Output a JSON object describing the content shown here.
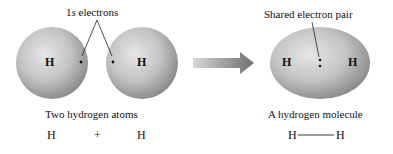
{
  "left_panel": {
    "callout_label": "1s electrons",
    "atom_left_symbol": "H",
    "atom_right_symbol": "H",
    "caption": "Two hydrogen atoms",
    "equation": {
      "left": "H",
      "operator": "+",
      "right": "H"
    }
  },
  "arrow": {
    "direction": "right",
    "icon": "gradient-arrow-icon"
  },
  "right_panel": {
    "callout_label": "Shared electron pair",
    "atom_left_symbol": "H",
    "atom_right_symbol": "H",
    "caption": "A hydrogen molecule",
    "formula": {
      "left": "H",
      "bond": "——",
      "right": "H"
    }
  },
  "colors": {
    "sphere_light": "#d8d8d8",
    "sphere_dark": "#8e8e8e",
    "arrow_light": "#d0d0d0",
    "arrow_dark": "#707070"
  }
}
